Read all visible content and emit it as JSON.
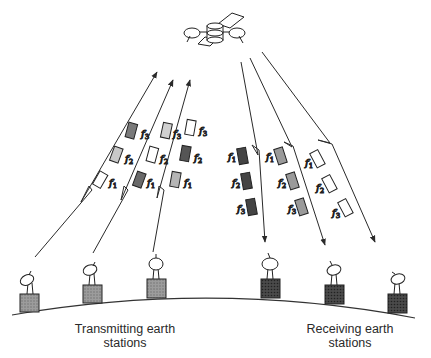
{
  "diagram": {
    "type": "satellite-fdma-illustration",
    "satellite": {
      "name": "satellite",
      "icon": "satellite-icon"
    },
    "labels": {
      "transmitting": "Transmitting earth\nstations",
      "transmitting_line1": "Transmitting earth",
      "transmitting_line2": "stations",
      "receiving_line1": "Receiving earth",
      "receiving_line2": "stations"
    },
    "uplinks": [
      {
        "station": "tx-1",
        "carriers": [
          {
            "f": "f1",
            "sub": "1",
            "shade": "#ffffff"
          },
          {
            "f": "f2",
            "sub": "2",
            "shade": "#c8c8c8"
          },
          {
            "f": "f3",
            "sub": "3",
            "shade": "#7a7a7a"
          }
        ]
      },
      {
        "station": "tx-2",
        "carriers": [
          {
            "f": "f1",
            "sub": "1",
            "shade": "#6a6a6a"
          },
          {
            "f": "f2",
            "sub": "2",
            "shade": "#ffffff"
          },
          {
            "f": "f3",
            "sub": "3",
            "shade": "#d0d0d0"
          }
        ]
      },
      {
        "station": "tx-3",
        "carriers": [
          {
            "f": "f1",
            "sub": "1",
            "shade": "#b5b5b5"
          },
          {
            "f": "f2",
            "sub": "2",
            "shade": "#555555"
          },
          {
            "f": "f3",
            "sub": "3",
            "shade": "#ffffff"
          }
        ]
      }
    ],
    "downlinks": [
      {
        "station": "rx-1",
        "carriers": [
          {
            "f": "f1",
            "sub": "1",
            "shade": "#444444"
          },
          {
            "f": "f2",
            "sub": "2",
            "shade": "#444444"
          },
          {
            "f": "f3",
            "sub": "3",
            "shade": "#444444"
          }
        ]
      },
      {
        "station": "rx-2",
        "carriers": [
          {
            "f": "f1",
            "sub": "1",
            "shade": "#9a9a9a"
          },
          {
            "f": "f2",
            "sub": "2",
            "shade": "#9a9a9a"
          },
          {
            "f": "f3",
            "sub": "3",
            "shade": "#9a9a9a"
          }
        ]
      },
      {
        "station": "rx-3",
        "carriers": [
          {
            "f": "f1",
            "sub": "1",
            "shade": "#ffffff"
          },
          {
            "f": "f2",
            "sub": "2",
            "shade": "#ffffff"
          },
          {
            "f": "f3",
            "sub": "3",
            "shade": "#ffffff"
          }
        ]
      }
    ],
    "colors": {
      "line": "#2a2a2a",
      "ground": "#333333"
    }
  }
}
